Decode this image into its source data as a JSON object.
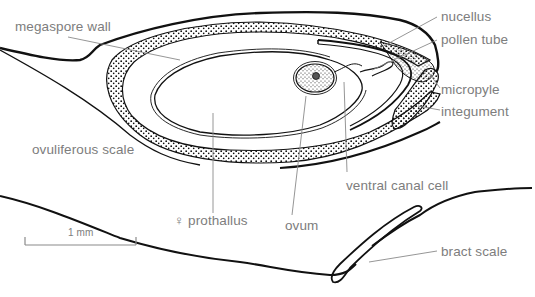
{
  "diagram": {
    "colors": {
      "ink": "#111111",
      "label": "#7d7d7d",
      "leader": "#8a8a8a",
      "background": "#ffffff"
    },
    "labels": [
      {
        "id": "megaspore-wall",
        "text": "megaspore wall",
        "x": 15,
        "y": 20
      },
      {
        "id": "nucellus",
        "text": "nucellus",
        "x": 441,
        "y": 10
      },
      {
        "id": "pollen-tube",
        "text": "pollen tube",
        "x": 441,
        "y": 33
      },
      {
        "id": "micropyle",
        "text": "micropyle",
        "x": 441,
        "y": 83
      },
      {
        "id": "integument",
        "text": "integument",
        "x": 441,
        "y": 105
      },
      {
        "id": "ovuliferous-scale",
        "text": "ovuliferous scale",
        "x": 32,
        "y": 143
      },
      {
        "id": "ventral-canal-cell",
        "text": "ventral canal cell",
        "x": 346,
        "y": 179
      },
      {
        "id": "prothallus",
        "text": "♀ prothallus",
        "x": 174,
        "y": 214
      },
      {
        "id": "ovum",
        "text": "ovum",
        "x": 285,
        "y": 219
      },
      {
        "id": "bract-scale",
        "text": "bract scale",
        "x": 441,
        "y": 245
      }
    ],
    "scale_bar": {
      "text": "1 mm",
      "length_px": 111
    }
  }
}
